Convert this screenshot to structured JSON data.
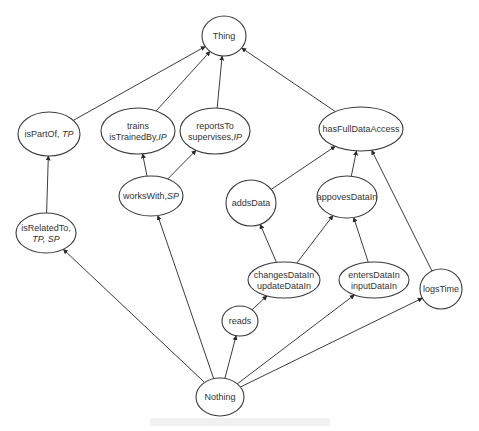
{
  "diagram": {
    "type": "hierarchy-graph",
    "colors": {
      "stroke": "#3a3a3a",
      "text": "#333333",
      "background": "#ffffff"
    },
    "nodes": [
      {
        "id": "thing",
        "cx": 224,
        "cy": 36,
        "rx": 22,
        "ry": 20,
        "lines": [
          [
            {
              "t": "Thing"
            }
          ]
        ]
      },
      {
        "id": "isPartOf",
        "cx": 49,
        "cy": 134,
        "rx": 31,
        "ry": 22,
        "lines": [
          [
            {
              "t": "isPartOf, "
            },
            {
              "t": "TP",
              "i": true
            }
          ]
        ]
      },
      {
        "id": "trains",
        "cx": 138,
        "cy": 131,
        "rx": 37,
        "ry": 23,
        "lines": [
          [
            {
              "t": "trains"
            }
          ],
          [
            {
              "t": "isTrainedBy,"
            },
            {
              "t": "IP",
              "i": true
            }
          ]
        ]
      },
      {
        "id": "reportsTo",
        "cx": 215,
        "cy": 131,
        "rx": 35,
        "ry": 23,
        "lines": [
          [
            {
              "t": "reportsTo"
            }
          ],
          [
            {
              "t": "supervises,"
            },
            {
              "t": "IP",
              "i": true
            }
          ]
        ]
      },
      {
        "id": "hasFullDataAccess",
        "cx": 361,
        "cy": 129,
        "rx": 42,
        "ry": 22,
        "lines": [
          [
            {
              "t": "hasFullDataAccess"
            }
          ]
        ]
      },
      {
        "id": "worksWith",
        "cx": 151,
        "cy": 196,
        "rx": 32,
        "ry": 20,
        "lines": [
          [
            {
              "t": "worksWith,"
            },
            {
              "t": "SP",
              "i": true
            }
          ]
        ]
      },
      {
        "id": "addsData",
        "cx": 251,
        "cy": 203,
        "rx": 25,
        "ry": 23,
        "lines": [
          [
            {
              "t": "addsData"
            }
          ]
        ]
      },
      {
        "id": "appovesDataIn",
        "cx": 347,
        "cy": 197,
        "rx": 30,
        "ry": 21,
        "lines": [
          [
            {
              "t": "appovesDataIn"
            }
          ]
        ]
      },
      {
        "id": "isRelatedTo",
        "cx": 46,
        "cy": 233,
        "rx": 30,
        "ry": 20,
        "lines": [
          [
            {
              "t": "isRelatedTo,"
            }
          ],
          [
            {
              "t": "TP, SP",
              "i": true
            }
          ]
        ]
      },
      {
        "id": "changesDataIn",
        "cx": 284,
        "cy": 280,
        "rx": 36,
        "ry": 18,
        "lines": [
          [
            {
              "t": "changesDataIn"
            }
          ],
          [
            {
              "t": "updateDataIn"
            }
          ]
        ]
      },
      {
        "id": "entersDataIn",
        "cx": 374,
        "cy": 280,
        "rx": 35,
        "ry": 18,
        "lines": [
          [
            {
              "t": "entersDataIn"
            }
          ],
          [
            {
              "t": "inputDataIn"
            }
          ]
        ]
      },
      {
        "id": "logsTime",
        "cx": 441,
        "cy": 289,
        "rx": 21,
        "ry": 20,
        "lines": [
          [
            {
              "t": "logsTime"
            }
          ]
        ]
      },
      {
        "id": "reads",
        "cx": 240,
        "cy": 321,
        "rx": 18,
        "ry": 15,
        "lines": [
          [
            {
              "t": "reads"
            }
          ]
        ]
      },
      {
        "id": "nothing",
        "cx": 220,
        "cy": 397,
        "rx": 24,
        "ry": 19,
        "lines": [
          [
            {
              "t": "Nothing"
            }
          ]
        ]
      }
    ],
    "edges": [
      {
        "from": "isPartOf",
        "to": "thing"
      },
      {
        "from": "trains",
        "to": "thing"
      },
      {
        "from": "reportsTo",
        "to": "thing"
      },
      {
        "from": "hasFullDataAccess",
        "to": "thing"
      },
      {
        "from": "isRelatedTo",
        "to": "isPartOf"
      },
      {
        "from": "worksWith",
        "to": "trains"
      },
      {
        "from": "worksWith",
        "to": "reportsTo"
      },
      {
        "from": "addsData",
        "to": "hasFullDataAccess"
      },
      {
        "from": "appovesDataIn",
        "to": "hasFullDataAccess"
      },
      {
        "from": "logsTime",
        "to": "hasFullDataAccess"
      },
      {
        "from": "changesDataIn",
        "to": "addsData"
      },
      {
        "from": "changesDataIn",
        "to": "appovesDataIn"
      },
      {
        "from": "entersDataIn",
        "to": "appovesDataIn"
      },
      {
        "from": "reads",
        "to": "changesDataIn"
      },
      {
        "from": "nothing",
        "to": "isRelatedTo"
      },
      {
        "from": "nothing",
        "to": "worksWith"
      },
      {
        "from": "nothing",
        "to": "reads"
      },
      {
        "from": "nothing",
        "to": "entersDataIn"
      },
      {
        "from": "nothing",
        "to": "logsTime"
      }
    ]
  }
}
